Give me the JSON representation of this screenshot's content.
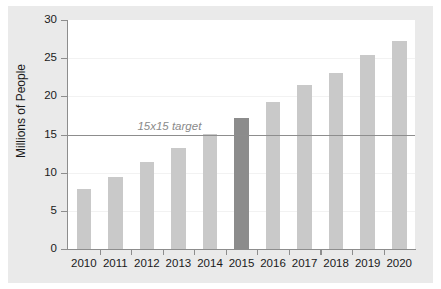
{
  "chart_data": {
    "type": "bar",
    "title": "",
    "xlabel": "",
    "ylabel": "Millions of People",
    "categories": [
      "2010",
      "2011",
      "2012",
      "2013",
      "2014",
      "2015",
      "2016",
      "2017",
      "2018",
      "2019",
      "2020"
    ],
    "values": [
      7.9,
      9.5,
      11.4,
      13.2,
      15.1,
      17.2,
      19.3,
      21.5,
      23.0,
      25.4,
      27.3
    ],
    "highlight_index": 5,
    "ylim": [
      0,
      30
    ],
    "yticks": [
      0,
      5,
      10,
      15,
      20,
      25,
      30
    ],
    "ytick_labels": [
      "0",
      "5",
      "10",
      "15",
      "20",
      "25",
      "30"
    ],
    "grid": true,
    "legend": "none",
    "annotations": [
      {
        "text": "15x15 target",
        "type": "hline",
        "y": 15
      }
    ],
    "colors": {
      "bar": "#c9c9c9",
      "bar_highlight": "#8c8c8c",
      "axis": "#8d8d8d",
      "grid": "#f2f2f2",
      "annotation_text": "#8a8a8a",
      "figure_background": "#eaeaea",
      "plot_background": "#ffffff",
      "tick_text": "#1a1a1a"
    }
  }
}
